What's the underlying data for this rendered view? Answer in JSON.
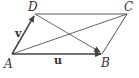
{
  "diagram": {
    "points": {
      "A": {
        "label": "A",
        "x": 12,
        "y": 54
      },
      "B": {
        "label": "B",
        "x": 102,
        "y": 54
      },
      "C": {
        "label": "C",
        "x": 127,
        "y": 14
      },
      "D": {
        "label": "D",
        "x": 35,
        "y": 14
      }
    },
    "vectors": {
      "u": {
        "label": "u",
        "from": "A",
        "to": "B"
      },
      "v": {
        "label": "v",
        "from": "A",
        "to": "D"
      }
    },
    "edges": [
      "D-C",
      "C-B"
    ],
    "diagonals": [
      "A-C",
      "D-B"
    ],
    "colors": {
      "stroke": "#444444",
      "background": "#ffffff"
    }
  }
}
